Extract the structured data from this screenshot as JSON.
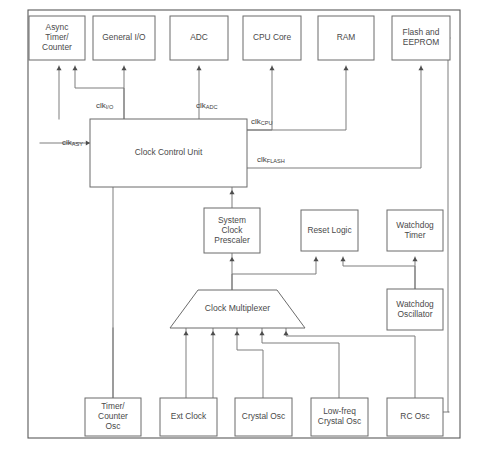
{
  "diagram": {
    "frame": {
      "x": 28,
      "y": 10,
      "width": 432,
      "height": 428
    },
    "colors": {
      "background": "#ffffff",
      "box_stroke": "#6b6b6b",
      "frame_stroke": "#5a5a5a",
      "wire": "#777777",
      "text": "#4a4a4a",
      "arrow": "#4d4d4d"
    },
    "nodes": [
      {
        "id": "async-timer-counter",
        "label": "Async Timer/ Counter",
        "lines": [
          "Async",
          "Timer/",
          "Counter"
        ],
        "shape": "rect",
        "x": 29,
        "y": 16,
        "width": 56,
        "height": 44
      },
      {
        "id": "general-io",
        "label": "General I/O",
        "lines": [
          "General I/O"
        ],
        "shape": "rect",
        "x": 93,
        "y": 16,
        "width": 62,
        "height": 44
      },
      {
        "id": "adc",
        "label": "ADC",
        "lines": [
          "ADC"
        ],
        "shape": "rect",
        "x": 170,
        "y": 16,
        "width": 58,
        "height": 44
      },
      {
        "id": "cpu-core",
        "label": "CPU Core",
        "lines": [
          "CPU Core"
        ],
        "shape": "rect",
        "x": 243,
        "y": 16,
        "width": 58,
        "height": 44
      },
      {
        "id": "ram",
        "label": "RAM",
        "lines": [
          "RAM"
        ],
        "shape": "rect",
        "x": 318,
        "y": 16,
        "width": 56,
        "height": 44
      },
      {
        "id": "flash-and-eeprom",
        "label": "Flash and EEPROM",
        "lines": [
          "Flash and",
          "EEPROM"
        ],
        "shape": "rect",
        "x": 392,
        "y": 16,
        "width": 58,
        "height": 44
      },
      {
        "id": "clock-control-unit",
        "label": "Clock Control Unit",
        "lines": [
          "Clock Control Unit"
        ],
        "shape": "rect",
        "x": 90,
        "y": 119,
        "width": 157,
        "height": 68
      },
      {
        "id": "system-clock-prescaler",
        "label": "System Clock Prescaler",
        "lines": [
          "System",
          "Clock",
          "Prescaler"
        ],
        "shape": "rect",
        "x": 204,
        "y": 208,
        "width": 56,
        "height": 45
      },
      {
        "id": "reset-logic",
        "label": "Reset Logic",
        "lines": [
          "Reset Logic"
        ],
        "shape": "rect",
        "x": 301,
        "y": 210,
        "width": 57,
        "height": 41
      },
      {
        "id": "watchdog-timer",
        "label": "Watchdog Timer",
        "lines": [
          "Watchdog",
          "Timer"
        ],
        "shape": "rect",
        "x": 387,
        "y": 210,
        "width": 56,
        "height": 41
      },
      {
        "id": "clock-multiplexer",
        "label": "Clock Multiplexer",
        "lines": [
          "Clock Multiplexer"
        ],
        "shape": "trapezoid",
        "x": 170,
        "y": 290,
        "width": 135,
        "height": 38,
        "inset": 28
      },
      {
        "id": "watchdog-oscillator",
        "label": "Watchdog Oscillator",
        "lines": [
          "Watchdog",
          "Oscillator"
        ],
        "shape": "rect",
        "x": 387,
        "y": 289,
        "width": 56,
        "height": 41
      },
      {
        "id": "timer-counter-osc",
        "label": "Timer/ Counter Osc",
        "lines": [
          "Timer/",
          "Counter",
          "Osc"
        ],
        "shape": "rect",
        "x": 85,
        "y": 398,
        "width": 56,
        "height": 38
      },
      {
        "id": "ext-clock",
        "label": "Ext Clock",
        "lines": [
          "Ext Clock"
        ],
        "shape": "rect",
        "x": 160,
        "y": 398,
        "width": 57,
        "height": 38
      },
      {
        "id": "crystal-osc",
        "label": "Crystal Osc",
        "lines": [
          "Crystal Osc"
        ],
        "shape": "rect",
        "x": 235,
        "y": 398,
        "width": 57,
        "height": 38
      },
      {
        "id": "low-freq-crystal-osc",
        "label": "Low-freq Crystal Osc",
        "lines": [
          "Low-freq",
          "Crystal Osc"
        ],
        "shape": "rect",
        "x": 311,
        "y": 398,
        "width": 57,
        "height": 38
      },
      {
        "id": "rc-osc",
        "label": "RC Osc",
        "lines": [
          "RC Osc"
        ],
        "shape": "rect",
        "x": 387,
        "y": 398,
        "width": 56,
        "height": 38
      }
    ],
    "clock_labels": [
      {
        "id": "clk-io",
        "base": "clk",
        "sub": "I/O",
        "x": 96,
        "y": 106
      },
      {
        "id": "clk-adc",
        "base": "clk",
        "sub": "ADC",
        "x": 196,
        "y": 106
      },
      {
        "id": "clk-cpu",
        "base": "clk",
        "sub": "CPU",
        "x": 251,
        "y": 122
      },
      {
        "id": "clk-flash",
        "base": "clk",
        "sub": "FLASH",
        "x": 257,
        "y": 160
      },
      {
        "id": "clk-asy",
        "base": "clk",
        "sub": "ASY",
        "x": 62,
        "y": 143
      }
    ],
    "wires": [
      {
        "id": "ccu-to-async-timer",
        "points": "59,119 59,66"
      },
      {
        "id": "ccu-to-async-timer-second",
        "points": "124,119 124,88 75,88 75,66"
      },
      {
        "id": "ccu-to-general-io",
        "points": "124,119 124,66"
      },
      {
        "id": "ccu-to-adc",
        "points": "199,119 199,66"
      },
      {
        "id": "ccu-to-cpu-core",
        "points": "247,130 272,130 272,66"
      },
      {
        "id": "ccu-to-ram",
        "points": "247,130 346,130 346,66"
      },
      {
        "id": "ccu-to-flash",
        "points": "247,168 421,168 421,66"
      },
      {
        "id": "ccu-asy-in",
        "points": "40,143 90,143"
      },
      {
        "id": "prescaler-to-ccu",
        "points": "232,208 232,187"
      },
      {
        "id": "mux-to-prescaler",
        "points": "232,290 232,253"
      },
      {
        "id": "mux-to-reset-logic",
        "points": "232,290 232,274 316,274 316,257"
      },
      {
        "id": "watchdog-osc-to-reset-logic",
        "points": "415,289 415,266 343,266 343,257"
      },
      {
        "id": "watchdog-osc-to-timer",
        "points": "415,289 415,257"
      },
      {
        "id": "flash-right-to-rc-osc",
        "points": "450,38 448,38 448,412 449,412"
      },
      {
        "id": "rc-osc-right",
        "points": "443,412 448,412"
      },
      {
        "id": "mux-in-1",
        "points": "186,328 186,398"
      },
      {
        "id": "mux-in-2",
        "points": "213,328 213,398"
      },
      {
        "id": "mux-in-3",
        "points": "237,328 237,350 263,350 263,398"
      },
      {
        "id": "mux-in-4",
        "points": "262,328 262,343 339,343 339,398"
      },
      {
        "id": "mux-in-5",
        "points": "286,328 286,336 415,336 415,398"
      },
      {
        "id": "timer-osc-to-mux",
        "points": "113,398 113,184"
      },
      {
        "id": "timer-osc-vertical",
        "points": "113,398 113,328"
      }
    ],
    "arrows": [
      {
        "id": "arrow-async-timer-left",
        "x": 59,
        "y": 66,
        "dir": "up"
      },
      {
        "id": "arrow-async-timer-right",
        "x": 75,
        "y": 66,
        "dir": "up"
      },
      {
        "id": "arrow-general-io",
        "x": 124,
        "y": 66,
        "dir": "up"
      },
      {
        "id": "arrow-adc",
        "x": 199,
        "y": 66,
        "dir": "up"
      },
      {
        "id": "arrow-cpu-core",
        "x": 272,
        "y": 66,
        "dir": "up"
      },
      {
        "id": "arrow-ram",
        "x": 346,
        "y": 66,
        "dir": "up"
      },
      {
        "id": "arrow-flash",
        "x": 421,
        "y": 66,
        "dir": "up"
      },
      {
        "id": "arrow-ccu-prescaler",
        "x": 232,
        "y": 190,
        "dir": "up"
      },
      {
        "id": "arrow-prescaler-in",
        "x": 232,
        "y": 257,
        "dir": "up"
      },
      {
        "id": "arrow-reset-left",
        "x": 316,
        "y": 257,
        "dir": "up"
      },
      {
        "id": "arrow-reset-right",
        "x": 343,
        "y": 257,
        "dir": "up"
      },
      {
        "id": "arrow-watchdog-timer",
        "x": 415,
        "y": 257,
        "dir": "up"
      },
      {
        "id": "arrow-mux-1",
        "x": 186,
        "y": 331,
        "dir": "up"
      },
      {
        "id": "arrow-mux-2",
        "x": 213,
        "y": 331,
        "dir": "up"
      },
      {
        "id": "arrow-mux-3",
        "x": 237,
        "y": 331,
        "dir": "up"
      },
      {
        "id": "arrow-mux-4",
        "x": 262,
        "y": 331,
        "dir": "up"
      },
      {
        "id": "arrow-mux-5",
        "x": 286,
        "y": 331,
        "dir": "up"
      },
      {
        "id": "arrow-ccu-asy",
        "x": 90,
        "y": 143,
        "dir": "right"
      }
    ]
  }
}
